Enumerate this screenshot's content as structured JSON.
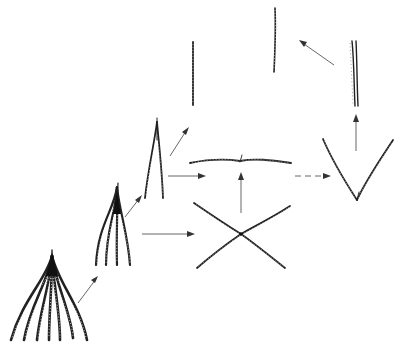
{
  "diagram": {
    "type": "morphological-transformation-sequence",
    "colors": {
      "line": "#222222",
      "arrow": "#555555",
      "background": "#ffffff"
    },
    "nodes": [
      {
        "id": "fan-7",
        "description": "fan of 7 curved striated rays joined at apex",
        "rays": 7
      },
      {
        "id": "fan-4",
        "description": "fan of 4 curved striated rays joined at apex",
        "rays": 4
      },
      {
        "id": "fork-2",
        "description": "two rays joined at apex (inverted V, narrow)",
        "rays": 2
      },
      {
        "id": "single-rod-a",
        "description": "single straight striated rod",
        "rays": 1
      },
      {
        "id": "horizontal-bar",
        "description": "horizontal slightly wavy striated bar with central mark",
        "rays": 2
      },
      {
        "id": "x-cross",
        "description": "two striated rays crossing in X shape",
        "rays": 2
      },
      {
        "id": "v-shape",
        "description": "two striated rays forming V joined at bottom",
        "rays": 2
      },
      {
        "id": "double-rod",
        "description": "vertical paired striated rod",
        "rays": 2
      },
      {
        "id": "single-rod-b",
        "description": "single vertical striated rod",
        "rays": 1
      }
    ],
    "edges": [
      {
        "from": "fan-7",
        "to": "fan-4",
        "style": "solid"
      },
      {
        "from": "fan-4",
        "to": "fork-2",
        "style": "solid"
      },
      {
        "from": "fan-4",
        "to": "x-cross",
        "style": "solid"
      },
      {
        "from": "fork-2",
        "to": "single-rod-a",
        "style": "solid"
      },
      {
        "from": "fork-2",
        "to": "horizontal-bar",
        "style": "solid"
      },
      {
        "from": "x-cross",
        "to": "horizontal-bar",
        "style": "solid"
      },
      {
        "from": "horizontal-bar",
        "to": "v-shape",
        "style": "dashed"
      },
      {
        "from": "v-shape",
        "to": "double-rod",
        "style": "solid"
      },
      {
        "from": "double-rod",
        "to": "single-rod-b",
        "style": "solid"
      }
    ],
    "labels": []
  }
}
